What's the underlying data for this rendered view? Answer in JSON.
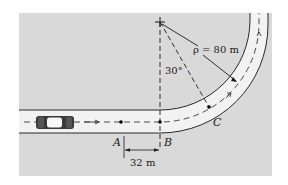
{
  "figure": {
    "background_color": "#ffffff",
    "panel_color": "#d9d9d9",
    "road_color": "#f2f2f2",
    "line_color": "#2a2a2a"
  },
  "labels": {
    "point_a": "A",
    "point_b": "B",
    "point_c": "C",
    "radius": "ρ = 80 m",
    "angle": "30°",
    "distance_ab": "32 m"
  },
  "geometry": {
    "radius_m": 80,
    "angle_deg": 30,
    "distance_ab_m": 32
  },
  "icons": {
    "car": "car-icon",
    "center_mark": "plus-crosshair-icon",
    "direction_arrow": "arrow-right-icon"
  }
}
